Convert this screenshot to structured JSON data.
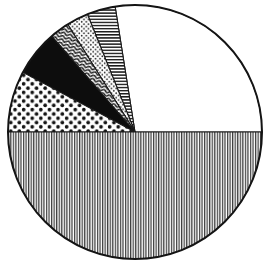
{
  "chart_data": {
    "type": "pie",
    "title": "",
    "subtitle": "",
    "xlabel": "",
    "ylabel": "",
    "legend_position": "none",
    "grid": false,
    "style": "monochrome-hatched-engraving",
    "center_x": 135,
    "center_y": 132,
    "radius": 127,
    "start_angle_deg": 0,
    "direction": "counterclockwise",
    "categories": [
      "Slice 1 (blank)",
      "Slice 2 (horizontal lines)",
      "Slice 3 (fine stipple)",
      "Slice 4 (wavy)",
      "Slice 5 (solid black)",
      "Slice 6 (polka dots)",
      "Slice 7 (vertical lines)"
    ],
    "values": [
      27.5,
      3.6,
      2.8,
      2.5,
      5.8,
      7.8,
      50.0
    ],
    "slices": [
      {
        "label": "Slice 1 (blank)",
        "value": 27.5,
        "start_deg": 0,
        "end_deg": 99,
        "pattern": "blank",
        "fill": "#ffffff",
        "ink": "#141414"
      },
      {
        "label": "Slice 2 (horizontal lines)",
        "value": 3.6,
        "start_deg": 99,
        "end_deg": 112,
        "pattern": "horizontal-lines",
        "fill": "#ffffff",
        "ink": "#1c1c1c"
      },
      {
        "label": "Slice 3 (fine stipple)",
        "value": 2.8,
        "start_deg": 112,
        "end_deg": 122,
        "pattern": "fine-stipple",
        "fill": "#ffffff",
        "ink": "#222222"
      },
      {
        "label": "Slice 4 (wavy)",
        "value": 2.5,
        "start_deg": 122,
        "end_deg": 131,
        "pattern": "wavy",
        "fill": "#ffffff",
        "ink": "#1a1a1a"
      },
      {
        "label": "Slice 5 (solid black)",
        "value": 5.8,
        "start_deg": 131,
        "end_deg": 152,
        "pattern": "solid",
        "fill": "#0d0d0d",
        "ink": "#0d0d0d"
      },
      {
        "label": "Slice 6 (polka dots)",
        "value": 7.8,
        "start_deg": 152,
        "end_deg": 180,
        "pattern": "polka-dots",
        "fill": "#ffffff",
        "ink": "#141414"
      },
      {
        "label": "Slice 7 (vertical lines)",
        "value": 50.0,
        "start_deg": 180,
        "end_deg": 360,
        "pattern": "vertical-lines",
        "fill": "#ffffff",
        "ink": "#3a3a3a"
      }
    ],
    "colors": {
      "background": "#ffffff",
      "outline": "#141414",
      "solid_slice": "#0d0d0d"
    }
  }
}
